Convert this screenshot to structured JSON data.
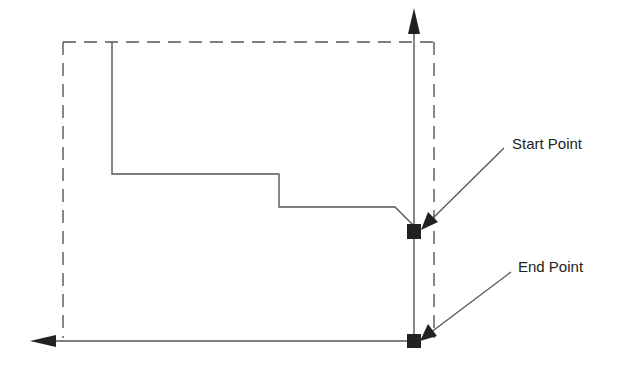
{
  "diagram": {
    "type": "toolpath-profile",
    "labels": {
      "start_point": "Start Point",
      "end_point": "End Point"
    },
    "colors": {
      "line": "#555555",
      "dashed": "#555555",
      "marker": "#222222",
      "background": "#ffffff"
    },
    "stock_boundary": {
      "style": "dashed",
      "left": 63,
      "top": 42,
      "right": 434,
      "bottom": 338
    },
    "profile_points": [
      [
        112,
        42
      ],
      [
        112,
        174
      ],
      [
        279,
        174
      ],
      [
        279,
        207
      ],
      [
        395,
        207
      ],
      [
        414,
        226
      ]
    ],
    "vertical_axis": {
      "x": 414,
      "y_from": 341,
      "y_to": 8,
      "arrow": "up"
    },
    "horizontal_axis": {
      "y": 341,
      "x_from": 414,
      "x_to": 30,
      "arrow": "left"
    },
    "start_marker": {
      "x": 414,
      "y": 231
    },
    "end_marker": {
      "x": 414,
      "y": 341
    }
  }
}
